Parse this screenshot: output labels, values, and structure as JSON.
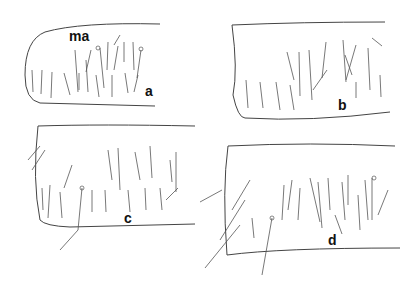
{
  "figure": {
    "panels": [
      {
        "id": "a",
        "label": "a",
        "annotation": "ma"
      },
      {
        "id": "b",
        "label": "b"
      },
      {
        "id": "c",
        "label": "c"
      },
      {
        "id": "d",
        "label": "d"
      }
    ],
    "colors": {
      "line": "#333333",
      "background": "#ffffff"
    }
  }
}
